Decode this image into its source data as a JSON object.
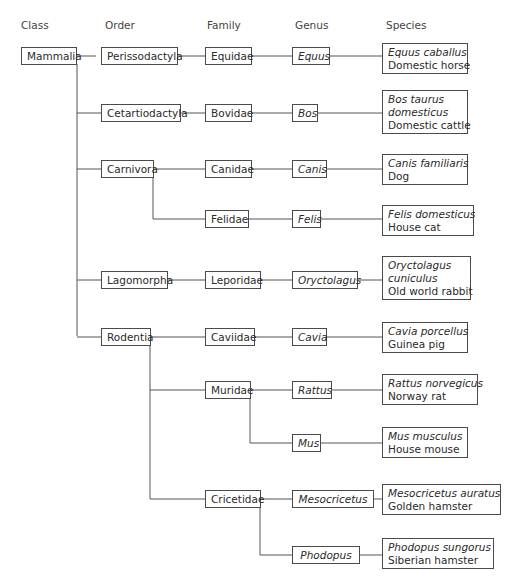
{
  "headers": {
    "class": "Class",
    "order": "Order",
    "family": "Family",
    "genus": "Genus",
    "species": "Species"
  },
  "class": {
    "name": "Mammalia"
  },
  "orders": {
    "perissodactyla": "Perissodactyla",
    "cetartiodactyla": "Cetartiodactyla",
    "carnivora": "Carnivora",
    "lagomorpha": "Lagomorpha",
    "rodentia": "Rodentia"
  },
  "families": {
    "equidae": "Equidae",
    "bovidae": "Bovidae",
    "canidae": "Canidae",
    "felidae": "Felidae",
    "leporidae": "Leporidae",
    "caviidae": "Caviidae",
    "muridae": "Muridae",
    "cricetidae": "Cricetidae"
  },
  "genera": {
    "equus": "Equus",
    "bos": "Bos",
    "canis": "Canis",
    "felis": "Felis",
    "oryctolagus": "Oryctolagus",
    "cavia": "Cavia",
    "rattus": "Rattus",
    "mus": "Mus",
    "mesocricetus": "Mesocricetus",
    "phodopus": "Phodopus"
  },
  "species": {
    "horse": {
      "scientific": [
        "Equus caballus"
      ],
      "common": "Domestic horse"
    },
    "cattle": {
      "scientific": [
        "Bos taurus",
        "domesticus"
      ],
      "common": "Domestic cattle"
    },
    "dog": {
      "scientific": [
        "Canis familiaris"
      ],
      "common": "Dog"
    },
    "cat": {
      "scientific": [
        "Felis domesticus"
      ],
      "common": "House cat"
    },
    "rabbit": {
      "scientific": [
        "Oryctolagus",
        "cuniculus"
      ],
      "common": "Old world rabbit"
    },
    "guinea_pig": {
      "scientific": [
        "Cavia porcellus"
      ],
      "common": "Guinea pig"
    },
    "rat": {
      "scientific": [
        "Rattus norvegicus"
      ],
      "common": "Norway rat"
    },
    "mouse": {
      "scientific": [
        "Mus musculus"
      ],
      "common": "House mouse"
    },
    "golden_hamster": {
      "scientific": [
        "Mesocricetus auratus"
      ],
      "common": "Golden hamster"
    },
    "siberian_hamster": {
      "scientific": [
        "Phodopus sungorus"
      ],
      "common": "Siberian hamster"
    }
  }
}
